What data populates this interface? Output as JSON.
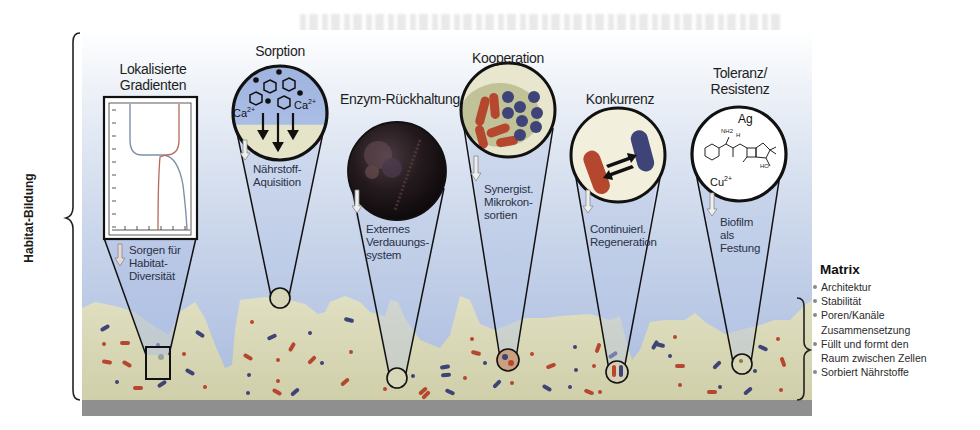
{
  "side_label": "Habitat-Bildung",
  "colors": {
    "water_top": "#e8edf5",
    "water_bottom": "#9fb4dc",
    "matrix_fill": "#d6d6b4",
    "substrate": "#8c8c8c",
    "red_cell": "#b5472e",
    "blue_cell": "#3e4477",
    "outline": "#111111"
  },
  "panels": [
    {
      "id": "gradients",
      "title": "Lokalisierte Gradienten",
      "title_lines": [
        "Lokalisierte",
        "Gradienten"
      ],
      "caption_lines": [
        "Sorgen für",
        "Habitat-",
        "Diversität"
      ],
      "icon": "gradient-plot-icon"
    },
    {
      "id": "sorption",
      "title": "Sorption",
      "title_lines": [
        "Sorption"
      ],
      "inner_labels": [
        "Ca2+",
        "Ca2+"
      ],
      "caption_lines": [
        "Nährstoff-",
        "Aquisition"
      ],
      "icon": "sorption-molecules-icon"
    },
    {
      "id": "enzyme",
      "title": "Enzym-Rückhaltung",
      "title_lines": [
        "Enzym-Rückhaltung"
      ],
      "caption_lines": [
        "Externes",
        "Verdauungs-",
        "system"
      ],
      "icon": "enzyme-micrograph-icon"
    },
    {
      "id": "cooperation",
      "title": "Kooperation",
      "title_lines": [
        "Kooperation"
      ],
      "caption_lines": [
        "Synergist.",
        "Mikrokon-",
        "sortien"
      ],
      "icon": "microconsortia-icon"
    },
    {
      "id": "competition",
      "title": "Konkurrenz",
      "title_lines": [
        "Konkurrenz"
      ],
      "caption_lines": [
        "Continuierl.",
        "Regeneration"
      ],
      "icon": "competing-cells-icon"
    },
    {
      "id": "tolerance",
      "title": "Toleranz/ Resistenz",
      "title_lines": [
        "Toleranz/",
        "Resistenz"
      ],
      "inner_labels": [
        "Ag",
        "Cu2+",
        "NH2",
        "H",
        "HO"
      ],
      "caption_lines": [
        "Biofilm",
        "als",
        "Festung"
      ],
      "icon": "antibiotic-molecule-icon"
    }
  ],
  "matrix": {
    "title": "Matrix",
    "items": [
      {
        "text": "Architektur",
        "bullet": true
      },
      {
        "text": "Stabilität",
        "bullet": true
      },
      {
        "text": "Poren/Kanäle",
        "bullet": true
      },
      {
        "text": "Zusammensetzung",
        "bullet": false
      },
      {
        "text": "Füllt und formt den",
        "bullet": true
      },
      {
        "text": "Raum zwischen Zellen",
        "bullet": false
      },
      {
        "text": "Sorbiert Nährstoffe",
        "bullet": true
      }
    ]
  }
}
